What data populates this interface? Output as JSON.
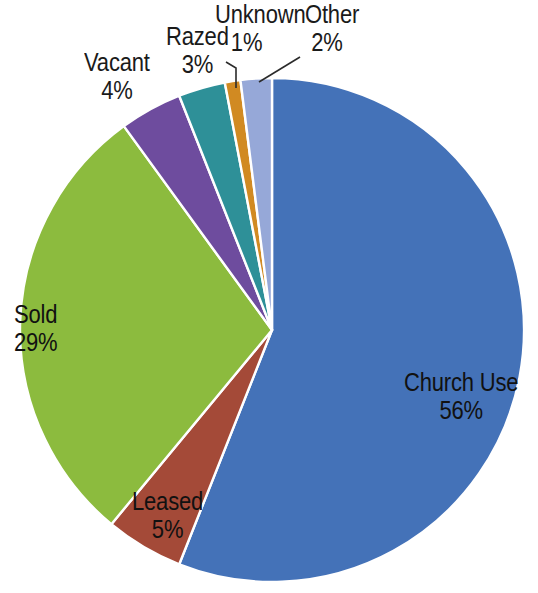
{
  "chart_data": {
    "type": "pie",
    "title": "",
    "subtitle": "",
    "xlabel": "",
    "ylabel": "",
    "legend_position": "none",
    "grid": false,
    "value_unit": "percent",
    "categories": [
      "Church Use",
      "Leased",
      "Sold",
      "Vacant",
      "Razed",
      "Unknown",
      "Other"
    ],
    "values": [
      56,
      5,
      29,
      4,
      3,
      1,
      2
    ],
    "slices": [
      {
        "label": "Church Use",
        "percent": 56,
        "percent_text": "56%",
        "color": "#4472b8",
        "label_placement": "inside"
      },
      {
        "label": "Leased",
        "percent": 5,
        "percent_text": "5%",
        "color": "#a44a38",
        "label_placement": "inside"
      },
      {
        "label": "Sold",
        "percent": 29,
        "percent_text": "29%",
        "color": "#8cbb3e",
        "label_placement": "inside"
      },
      {
        "label": "Vacant",
        "percent": 4,
        "percent_text": "4%",
        "color": "#6e4c9e",
        "label_placement": "outside"
      },
      {
        "label": "Razed",
        "percent": 3,
        "percent_text": "3%",
        "color": "#2e9098",
        "label_placement": "outside"
      },
      {
        "label": "Unknown",
        "percent": 1,
        "percent_text": "1%",
        "color": "#d18a22",
        "label_placement": "outside-leader"
      },
      {
        "label": "Other",
        "percent": 2,
        "percent_text": "2%",
        "color": "#96a8d8",
        "label_placement": "outside-leader"
      }
    ],
    "start_angle_deg": 0,
    "direction": "clockwise",
    "geometry": {
      "cx": 272,
      "cy": 330,
      "r": 252
    },
    "slice_border_color": "#ffffff",
    "background_color": "#ffffff"
  },
  "labels": {
    "church_use": {
      "name": "Church Use",
      "percent": "56%"
    },
    "leased": {
      "name": "Leased",
      "percent": "5%"
    },
    "sold": {
      "name": "Sold",
      "percent": "29%"
    },
    "vacant": {
      "name": "Vacant",
      "percent": "4%"
    },
    "razed": {
      "name": "Razed",
      "percent": "3%"
    },
    "unknown": {
      "name": "Unknown",
      "percent": "1%"
    },
    "other": {
      "name": "Other",
      "percent": "2%"
    }
  }
}
